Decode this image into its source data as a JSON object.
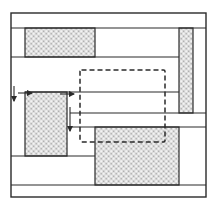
{
  "diagram": {
    "type": "floorplan-packing-layout",
    "colors": {
      "line": "#2a2a2a",
      "hatch_light": "#e2e2e2",
      "hatch_dark": "#9a9a9a",
      "background": "#ffffff"
    },
    "frame": {
      "x": 11,
      "y": 13,
      "w": 195,
      "h": 184
    },
    "horizontal_lines": [
      {
        "y": 28,
        "x1": 11,
        "x2": 206
      },
      {
        "y": 57,
        "x1": 11,
        "x2": 179
      },
      {
        "y": 92,
        "x1": 25,
        "x2": 179
      },
      {
        "y": 113,
        "x1": 70,
        "x2": 206
      },
      {
        "y": 127,
        "x1": 70,
        "x2": 206
      },
      {
        "y": 156,
        "x1": 11,
        "x2": 95
      },
      {
        "y": 185,
        "x1": 11,
        "x2": 206
      }
    ],
    "hatched_blocks": [
      {
        "name": "block-top-left",
        "x": 25,
        "y": 28,
        "w": 70,
        "h": 29
      },
      {
        "name": "block-right-column",
        "x": 179,
        "y": 28,
        "w": 14,
        "h": 85
      },
      {
        "name": "block-left-middle",
        "x": 25,
        "y": 92,
        "w": 42,
        "h": 64
      },
      {
        "name": "block-bottom-right",
        "x": 95,
        "y": 127,
        "w": 84,
        "h": 58
      }
    ],
    "dashed_region": {
      "x": 80,
      "y": 70,
      "w": 85,
      "h": 72
    },
    "arrows": [
      {
        "name": "left-down-arrow",
        "x1": 14,
        "y1": 86,
        "x2": 14,
        "y2": 101
      },
      {
        "name": "left-right-arrow",
        "x1": 18,
        "y1": 93,
        "x2": 32,
        "y2": 93
      },
      {
        "name": "mid-right-arrow",
        "x1": 60,
        "y1": 94,
        "x2": 74,
        "y2": 94
      },
      {
        "name": "mid-down-arrow",
        "x1": 70,
        "y1": 107,
        "x2": 70,
        "y2": 131
      }
    ]
  }
}
